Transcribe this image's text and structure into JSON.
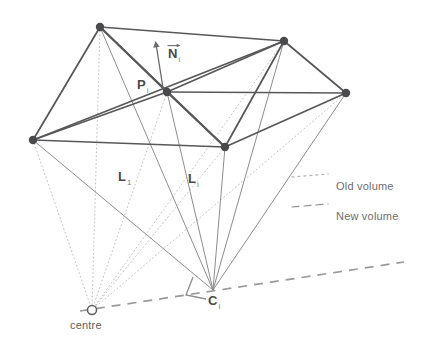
{
  "figure": {
    "width": 429,
    "height": 347,
    "background": "#ffffff"
  },
  "colors": {
    "mesh_edge": "#58585a",
    "vertex_fill": "#4a4a4c",
    "new_volume_line": "#8d8d90",
    "old_volume_line": "#b9b9bc",
    "dashed_axis": "#9a9a9d",
    "label_text": "#5c5c5c",
    "normal_arrow": "#6b6b6e"
  },
  "labels": {
    "point_p": {
      "base": "P",
      "sub": "i",
      "x": 137,
      "y": 78
    },
    "normal_n": {
      "base": "N",
      "sub": "i",
      "x": 168,
      "y": 47
    },
    "length_l1": {
      "base": "L",
      "sub": "1",
      "x": 118,
      "y": 170
    },
    "length_l2": {
      "base": "L",
      "sub": "i",
      "x": 188,
      "y": 172
    },
    "point_c": {
      "base": "C",
      "sub": "i",
      "x": 208,
      "y": 294
    },
    "centre": {
      "text": "centre",
      "x": 70,
      "y": 320
    }
  },
  "legend": {
    "items": [
      {
        "label": "Old volume",
        "style": "dotted",
        "color": "#b9b9bc",
        "x": 336,
        "y": 181
      },
      {
        "label": "New volume",
        "style": "solid",
        "color": "#8d8d90",
        "x": 336,
        "y": 211
      }
    ],
    "swatch_x": 292,
    "swatch_width": 36
  },
  "geometry": {
    "vertices": [
      {
        "name": "v-top-left",
        "x": 100,
        "y": 27
      },
      {
        "name": "v-top-right",
        "x": 284,
        "y": 41
      },
      {
        "name": "v-right",
        "x": 346,
        "y": 93
      },
      {
        "name": "v-bottom-mid",
        "x": 225,
        "y": 147
      },
      {
        "name": "v-left",
        "x": 33,
        "y": 140
      },
      {
        "name": "v-center-p",
        "x": 167,
        "y": 92
      }
    ],
    "mesh_edges": [
      [
        100,
        27,
        284,
        41
      ],
      [
        284,
        41,
        346,
        93
      ],
      [
        346,
        93,
        225,
        147
      ],
      [
        225,
        147,
        33,
        140
      ],
      [
        33,
        140,
        100,
        27
      ],
      [
        100,
        27,
        167,
        92
      ],
      [
        284,
        41,
        167,
        92
      ],
      [
        346,
        93,
        167,
        92
      ],
      [
        225,
        147,
        167,
        92
      ],
      [
        33,
        140,
        167,
        92
      ],
      [
        100,
        27,
        225,
        147
      ],
      [
        284,
        41,
        225,
        147
      ],
      [
        33,
        140,
        284,
        41
      ]
    ],
    "apex_c": {
      "x": 213,
      "y": 290
    },
    "centre_o": {
      "x": 92,
      "y": 310
    },
    "centre_marker_radius": 4.5,
    "new_volume_rays": [
      [
        100,
        27,
        213,
        290
      ],
      [
        284,
        41,
        213,
        290
      ],
      [
        346,
        93,
        213,
        290
      ],
      [
        225,
        147,
        213,
        290
      ],
      [
        33,
        140,
        213,
        290
      ],
      [
        167,
        92,
        213,
        290
      ]
    ],
    "old_volume_rays": [
      [
        100,
        27,
        92,
        310
      ],
      [
        284,
        41,
        92,
        310
      ],
      [
        346,
        93,
        92,
        310
      ],
      [
        225,
        147,
        92,
        310
      ],
      [
        33,
        140,
        92,
        310
      ],
      [
        167,
        92,
        92,
        310
      ]
    ],
    "dashed_axis": {
      "x1": 80,
      "y1": 311,
      "x2": 404,
      "y2": 262
    },
    "right_angle_mark": [
      [
        193,
        277
      ],
      [
        186,
        295
      ],
      [
        206,
        299
      ]
    ],
    "normal_vector": {
      "x1": 163,
      "y1": 88,
      "x2": 156,
      "y2": 44
    }
  }
}
